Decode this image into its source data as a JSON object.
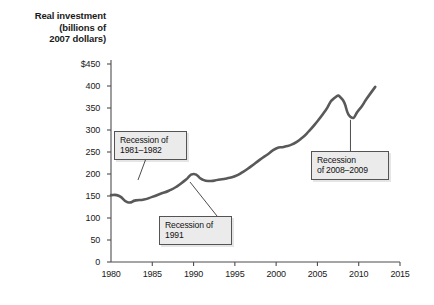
{
  "chart_data": {
    "type": "line",
    "title": "Real investment (billions of 2007 dollars)",
    "title_lines": [
      "Real investment",
      "(billions of",
      "2007 dollars)"
    ],
    "xlabel": "",
    "ylabel": "Real investment (billions of 2007 dollars)",
    "xlim": [
      1980,
      2015
    ],
    "ylim": [
      0,
      450
    ],
    "grid": false,
    "legend": null,
    "xticks": [
      "1980",
      "1985",
      "1990",
      "1995",
      "2000",
      "2005",
      "2010",
      "2015"
    ],
    "xtick_values": [
      1980,
      1985,
      1990,
      1995,
      2000,
      2005,
      2010,
      2015
    ],
    "yticks": [
      "0",
      "50",
      "100",
      "150",
      "200",
      "250",
      "300",
      "350",
      "400",
      "$450"
    ],
    "ytick_values": [
      0,
      50,
      100,
      150,
      200,
      250,
      300,
      350,
      400,
      450
    ],
    "line_color": "#595959",
    "series": [
      {
        "name": "Real investment",
        "x": [
          1980,
          1981,
          1982,
          1983,
          1984,
          1985,
          1986,
          1987,
          1988,
          1989,
          1990,
          1991,
          1992,
          1993,
          1994,
          1995,
          1996,
          1997,
          1998,
          1999,
          2000,
          2001,
          2002,
          2003,
          2004,
          2005,
          2006,
          2007,
          2008,
          2009,
          2010,
          2011,
          2012
        ],
        "values": [
          152,
          150,
          136,
          140,
          142,
          148,
          155,
          162,
          172,
          186,
          200,
          188,
          184,
          187,
          190,
          195,
          205,
          218,
          232,
          245,
          258,
          262,
          268,
          280,
          298,
          320,
          345,
          372,
          370,
          330,
          345,
          372,
          398
        ]
      }
    ],
    "annotations": [
      {
        "label": "Recession of 1981–1982",
        "lines": [
          "Recession of",
          "1981–1982"
        ],
        "target_year": 1982,
        "target_value": 136
      },
      {
        "label": "Recession of 1991",
        "lines": [
          "Recession of",
          "1991"
        ],
        "target_year": 1991,
        "target_value": 188
      },
      {
        "label": "Recession of 2008–2009",
        "lines": [
          "Recession",
          "of 2008–2009"
        ],
        "target_year": 2009,
        "target_value": 330
      }
    ]
  }
}
